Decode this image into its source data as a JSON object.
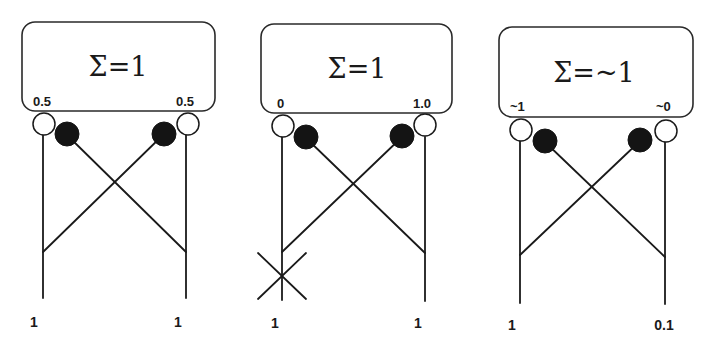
{
  "diagrams": [
    {
      "sum_label": "Σ=1",
      "left_weight": "0.5",
      "right_weight": "0.5",
      "left_input": "1",
      "right_input": "1",
      "left_input_blocked": false
    },
    {
      "sum_label": "Σ=1",
      "left_weight": "0",
      "right_weight": "1.0",
      "left_input": "1",
      "right_input": "1",
      "left_input_blocked": true
    },
    {
      "sum_label": "Σ=~1",
      "left_weight": "~1",
      "right_weight": "~0",
      "left_input": "1",
      "right_input": "0.1",
      "left_input_blocked": false
    }
  ],
  "legend": {
    "open_circle": "excitatory-synapse",
    "filled_circle": "inhibitory-synapse",
    "cross_mark": "blocked-input"
  }
}
